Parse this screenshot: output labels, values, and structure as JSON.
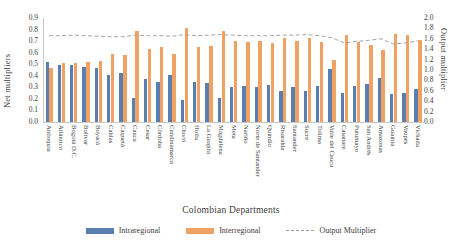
{
  "chart_data": {
    "type": "bar",
    "title": "",
    "xlabel": "Colombian Departments",
    "ylabel": "Net multipliers",
    "ylabel_right": "Output multiplier",
    "ylim": [
      0,
      0.9
    ],
    "ylim_right": [
      0,
      2.0
    ],
    "grid": false,
    "legend_position": "bottom",
    "yticks": [
      "0.9",
      "0.8",
      "0.7",
      "0.6",
      "0.5",
      "0.4",
      "0.3",
      "0.2",
      "0.1",
      "0.0"
    ],
    "yticks_right": [
      "2.0",
      "1.8",
      "1.6",
      "1.4",
      "1.2",
      "1.0",
      "0.8",
      "0.6",
      "0.4",
      "0.2",
      "0.0"
    ],
    "categories": [
      "Antioquia",
      "Atlántico",
      "Bogotá D.C.",
      "Bolívar",
      "Boyacá",
      "Caldas",
      "Caquetá",
      "Cauca",
      "Cesar",
      "Córdoba",
      "Cundinamarca",
      "Chocó",
      "Huila",
      "La Guajira",
      "Magdalena",
      "Meta",
      "Nariño",
      "Norte de Santander",
      "Quindío",
      "Risaralda",
      "Santander",
      "Sucre",
      "Tolima",
      "Valle del Cauca",
      "Casanare",
      "Putumayo",
      "San Andrés",
      "Amazonas",
      "Guainía",
      "Vaupés",
      "Vichada"
    ],
    "series": [
      {
        "name": "Intraregional",
        "color": "#5a7fae",
        "axis": "left",
        "values": [
          0.52,
          0.49,
          0.49,
          0.48,
          0.47,
          0.41,
          0.42,
          0.21,
          0.37,
          0.35,
          0.41,
          0.19,
          0.35,
          0.34,
          0.21,
          0.3,
          0.31,
          0.3,
          0.32,
          0.27,
          0.3,
          0.27,
          0.31,
          0.46,
          0.25,
          0.31,
          0.33,
          0.38,
          0.24,
          0.25,
          0.29
        ]
      },
      {
        "name": "Interregional",
        "color": "#f0a264",
        "axis": "left",
        "values": [
          0.47,
          0.51,
          0.51,
          0.52,
          0.53,
          0.59,
          0.58,
          0.79,
          0.63,
          0.65,
          0.59,
          0.81,
          0.65,
          0.66,
          0.79,
          0.7,
          0.69,
          0.7,
          0.68,
          0.73,
          0.7,
          0.73,
          0.69,
          0.54,
          0.75,
          0.69,
          0.67,
          0.62,
          0.76,
          0.75,
          0.71
        ]
      },
      {
        "name": "Output Multiplier",
        "color": "#9b9b9b",
        "axis": "right",
        "style": "dashed",
        "values": [
          1.66,
          1.66,
          1.67,
          1.66,
          1.65,
          1.64,
          1.64,
          1.67,
          1.66,
          1.66,
          1.65,
          1.68,
          1.66,
          1.67,
          1.68,
          1.67,
          1.66,
          1.66,
          1.66,
          1.67,
          1.67,
          1.68,
          1.66,
          1.62,
          1.52,
          1.55,
          1.57,
          1.6,
          1.5,
          1.52,
          1.56
        ]
      }
    ]
  },
  "legend": {
    "items": [
      {
        "label": "Intraregional"
      },
      {
        "label": "Interregional"
      },
      {
        "label": "Output Multiplier"
      }
    ]
  }
}
